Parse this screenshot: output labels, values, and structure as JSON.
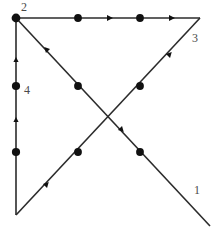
{
  "figure": {
    "background_color": "#ffffff",
    "line_color": "#2b2b2b",
    "node_color": "#111111",
    "label_color": "#4a4a4a",
    "width": 213,
    "height": 227
  },
  "labels": [
    {
      "id": "label-1",
      "text": "1",
      "x": 194,
      "y": 190
    },
    {
      "id": "label-2",
      "text": "2",
      "x": 21,
      "y": 2
    },
    {
      "id": "label-3",
      "text": "3",
      "x": 192,
      "y": 34
    },
    {
      "id": "label-4",
      "text": "4",
      "x": 24,
      "y": 84
    }
  ],
  "vertices": [
    {
      "id": "vertex-top-left",
      "x": 16,
      "y": 18
    },
    {
      "id": "vertex-top-right",
      "x": 200,
      "y": 18
    },
    {
      "id": "vertex-bottom-left",
      "x": 16,
      "y": 215
    }
  ],
  "edges": [
    {
      "id": "edge-top-horizontal",
      "from": "vertex-top-left",
      "to": "vertex-top-right",
      "x1": 16,
      "y1": 18,
      "x2": 200,
      "y2": 18,
      "direction": "rightward"
    },
    {
      "id": "edge-left-vertical",
      "from": "vertex-bottom-left",
      "to": "vertex-top-left",
      "x1": 16,
      "y1": 215,
      "x2": 16,
      "y2": 18,
      "direction": "upward"
    },
    {
      "id": "edge-diagonal-nw-se",
      "from": "vertex-top-left",
      "to": "corner-bottom-right",
      "x1": 16,
      "y1": 18,
      "x2": 210,
      "y2": 226,
      "direction": "up-left"
    },
    {
      "id": "edge-diagonal-sw-ne",
      "from": "vertex-bottom-left",
      "to": "vertex-top-right",
      "x1": 16,
      "y1": 215,
      "x2": 200,
      "y2": 18,
      "direction": "up-right"
    }
  ],
  "large_nodes": [
    {
      "id": "node-top-left-vertex",
      "x": 16,
      "y": 18,
      "r": 4.2
    },
    {
      "id": "node-top-mid-left",
      "x": 78,
      "y": 18,
      "r": 3.8
    },
    {
      "id": "node-top-mid-right",
      "x": 140,
      "y": 18,
      "r": 3.8
    },
    {
      "id": "node-left-upper",
      "x": 16,
      "y": 86,
      "r": 4.0
    },
    {
      "id": "node-left-lower",
      "x": 16,
      "y": 152,
      "r": 4.0
    },
    {
      "id": "node-nwse-upper",
      "x": 78,
      "y": 86,
      "r": 3.8
    },
    {
      "id": "node-nwse-lower",
      "x": 140,
      "y": 152,
      "r": 3.8
    },
    {
      "id": "node-swne-upper",
      "x": 140,
      "y": 86,
      "r": 3.8
    },
    {
      "id": "node-swne-lower",
      "x": 78,
      "y": 152,
      "r": 3.8
    }
  ],
  "arrow_markers": [
    {
      "id": "arrow-top-1",
      "x": 110,
      "y": 18,
      "angle": 0
    },
    {
      "id": "arrow-top-2",
      "x": 172,
      "y": 18,
      "angle": 0
    },
    {
      "id": "arrow-left-upper",
      "x": 16,
      "y": 60,
      "angle": -90
    },
    {
      "id": "arrow-left-lower",
      "x": 16,
      "y": 120,
      "angle": -90
    },
    {
      "id": "arrow-nwse-upper",
      "x": 46,
      "y": 54,
      "angle": 227
    },
    {
      "id": "arrow-nwse-lower",
      "x": 122,
      "y": 130,
      "angle": 47
    },
    {
      "id": "arrow-swne-upper",
      "x": 170,
      "y": 54,
      "angle": -47
    },
    {
      "id": "arrow-swne-lower",
      "x": 47,
      "y": 184,
      "angle": -47
    }
  ]
}
